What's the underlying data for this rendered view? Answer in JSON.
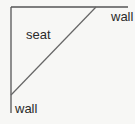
{
  "diagram": {
    "labels": {
      "wall_top": "wall",
      "seat": "seat",
      "wall_bottom": "wall"
    },
    "colors": {
      "wall_line": "#555555",
      "diagonal_line": "#666666",
      "background": "#f7f7f5"
    }
  }
}
